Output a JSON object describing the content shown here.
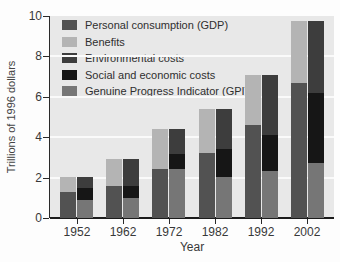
{
  "chart_data": {
    "type": "bar",
    "stacked": true,
    "grouped": true,
    "title": "",
    "xlabel": "Year",
    "ylabel": "Trillions of 1996 dollars",
    "ylim": [
      0,
      10
    ],
    "yticks": [
      0,
      2,
      4,
      6,
      8,
      10
    ],
    "grid": "horizontal white lines on light gray plot background",
    "legend_position": "top-left inside plot",
    "categories": [
      "1952",
      "1962",
      "1972",
      "1982",
      "1992",
      "2002"
    ],
    "bar_groups": [
      {
        "name": "gdp-bar",
        "description": "left bar per year, segments bottom to top",
        "segments": [
          {
            "series": "Personal consumption (GDP)",
            "color": "#525252",
            "values": [
              1.3,
              1.6,
              2.45,
              3.2,
              4.6,
              6.7
            ]
          },
          {
            "series": "Benefits",
            "color": "#b4b4b4",
            "values": [
              0.75,
              1.3,
              1.95,
              2.2,
              2.5,
              3.05
            ]
          }
        ]
      },
      {
        "name": "gpi-bar",
        "description": "right bar per year, segments bottom to top",
        "segments": [
          {
            "series": "Genuine Progress Indicator (GPI)",
            "color": "#767676",
            "values": [
              0.9,
              1.0,
              2.45,
              2.05,
              2.35,
              2.7
            ]
          },
          {
            "series": "Social and economic costs",
            "color": "#161616",
            "values": [
              0.6,
              0.6,
              0.7,
              1.35,
              1.75,
              3.5
            ]
          },
          {
            "series": "Environmental costs",
            "color": "#3d3d3d",
            "values": [
              0.55,
              1.3,
              1.25,
              2.0,
              3.0,
              3.55
            ]
          }
        ]
      }
    ],
    "totals_per_year": [
      2.05,
      2.9,
      4.4,
      5.4,
      7.1,
      9.75
    ],
    "legend": [
      {
        "label": "Personal consumption (GDP)",
        "color": "#525252"
      },
      {
        "label": "Benefits",
        "color": "#b4b4b4"
      },
      {
        "label": "Environmental costs",
        "color": "#3d3d3d"
      },
      {
        "label": "Social and economic costs",
        "color": "#161616"
      },
      {
        "label": "Genuine Progress Indicator (GPI)",
        "color": "#767676"
      }
    ],
    "colors": {
      "plot_background": "#e8e8e8",
      "gridline": "#fafafa",
      "axis": "#1b1b1b",
      "text": "#383838"
    }
  }
}
